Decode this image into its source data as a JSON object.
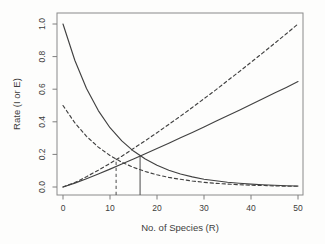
{
  "figure": {
    "background": "#fdfdfc",
    "frame_color": "#8a8a8a",
    "tick_color": "#7e7e7e",
    "curve_color": "#414141",
    "marker_color": "#5a5a5a",
    "text_color": "#3d3d3d"
  },
  "chart_data": {
    "type": "line",
    "title": "",
    "xlabel": "No. of Species (R)",
    "ylabel": "Rate (I or E)",
    "xlim": [
      0,
      50
    ],
    "ylim": [
      0.0,
      1.0
    ],
    "x_ticks": [
      {
        "value": 0,
        "label": "0"
      },
      {
        "value": 10,
        "label": "10"
      },
      {
        "value": 20,
        "label": "20"
      },
      {
        "value": 30,
        "label": "30"
      },
      {
        "value": 40,
        "label": "40"
      },
      {
        "value": 50,
        "label": "50"
      }
    ],
    "y_ticks": [
      {
        "value": 0.0,
        "label": "0.0"
      },
      {
        "value": 0.2,
        "label": "0.2"
      },
      {
        "value": 0.4,
        "label": "0.4"
      },
      {
        "value": 0.6,
        "label": "0.6"
      },
      {
        "value": 0.8,
        "label": "0.8"
      },
      {
        "value": 1.0,
        "label": "1.0"
      }
    ],
    "grid": false,
    "legend": "none",
    "x_samples": [
      0,
      2.5,
      5,
      7.5,
      10,
      12.5,
      15,
      17.5,
      20,
      22.5,
      25,
      27.5,
      30,
      32.5,
      35,
      37.5,
      40,
      42.5,
      45,
      47.5,
      50
    ],
    "series": [
      {
        "name": "immigration-rate-solid",
        "style": "solid",
        "description": "Immigration rate declining from 1.0 at R=0",
        "values": [
          1.0,
          0.777,
          0.604,
          0.469,
          0.364,
          0.283,
          0.22,
          0.171,
          0.133,
          0.103,
          0.08,
          0.062,
          0.048,
          0.038,
          0.029,
          0.023,
          0.018,
          0.014,
          0.011,
          0.008,
          0.006
        ]
      },
      {
        "name": "immigration-rate-dashed",
        "style": "dashed",
        "description": "Immigration rate declining from 0.5 at R=0",
        "values": [
          0.5,
          0.394,
          0.311,
          0.245,
          0.193,
          0.152,
          0.12,
          0.095,
          0.075,
          0.059,
          0.047,
          0.037,
          0.029,
          0.023,
          0.018,
          0.014,
          0.011,
          0.009,
          0.007,
          0.005,
          0.004
        ]
      },
      {
        "name": "extinction-rate-solid",
        "style": "solid",
        "description": "Extinction rate rising from 0 to ~0.65 at R=50",
        "values": [
          0,
          0.024,
          0.051,
          0.08,
          0.11,
          0.141,
          0.172,
          0.204,
          0.236,
          0.269,
          0.302,
          0.335,
          0.369,
          0.403,
          0.437,
          0.471,
          0.506,
          0.541,
          0.576,
          0.611,
          0.647
        ]
      },
      {
        "name": "extinction-rate-dashed",
        "style": "dashed",
        "description": "Extinction rate rising from 0 to 1.0 at R=50",
        "values": [
          0,
          0.027,
          0.063,
          0.103,
          0.145,
          0.189,
          0.236,
          0.284,
          0.333,
          0.384,
          0.435,
          0.488,
          0.542,
          0.596,
          0.652,
          0.708,
          0.765,
          0.823,
          0.881,
          0.94,
          1.0
        ]
      }
    ],
    "equilibria": [
      {
        "name": "equilibrium-dashed",
        "style": "dashed",
        "x": 11.3,
        "y": 0.17
      },
      {
        "name": "equilibrium-solid",
        "style": "solid",
        "x": 16.4,
        "y": 0.19
      }
    ]
  }
}
